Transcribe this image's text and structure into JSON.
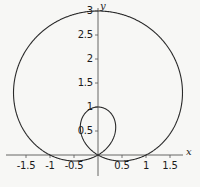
{
  "figure": {
    "background_color": "#f7f7f5",
    "curve_color": "#2a2a2a",
    "axis_color": "#555555",
    "width": 200,
    "height": 187
  },
  "axes": {
    "x_label": "x",
    "y_label": "y",
    "origin_px": {
      "x": 98,
      "y": 155
    },
    "scale_px_per_unit": 48,
    "x_ticks": [
      {
        "value": -1.5,
        "label": "-1.5",
        "px": 26
      },
      {
        "value": -1,
        "label": "-1",
        "px": 50
      },
      {
        "value": -0.5,
        "label": "-0.5",
        "px": 74
      },
      {
        "value": 0.5,
        "label": "0.5",
        "px": 122
      },
      {
        "value": 1,
        "label": "1",
        "px": 146
      },
      {
        "value": 1.5,
        "label": "1.5",
        "px": 170
      }
    ],
    "y_ticks": [
      {
        "value": 3,
        "label": "3",
        "px": 11
      },
      {
        "value": 2.5,
        "label": "2.5",
        "px": 35
      },
      {
        "value": 2,
        "label": "2",
        "px": 59
      },
      {
        "value": 1.5,
        "label": "1.5",
        "px": 83
      },
      {
        "value": 1,
        "label": "1",
        "px": 107
      },
      {
        "value": 0.5,
        "label": "0.5",
        "px": 131
      }
    ]
  },
  "chart_data": {
    "type": "line",
    "title": "",
    "xlabel": "x",
    "ylabel": "y",
    "curve_name": "limacon-with-inner-loop",
    "polar_equation": "r = 1 + 2 sin(theta)",
    "xlim": [
      -1.75,
      1.9
    ],
    "ylim": [
      -0.15,
      3.15
    ],
    "grid": false,
    "legend": "none",
    "key_points": [
      {
        "label": "top of outer loop",
        "x": 0,
        "y": 3
      },
      {
        "label": "leftmost point",
        "x": -1.63,
        "y": 1.13
      },
      {
        "label": "rightmost point",
        "x": 1.63,
        "y": 1.13
      },
      {
        "label": "origin / node",
        "x": 0,
        "y": 0
      },
      {
        "label": "top of inner loop",
        "x": 0,
        "y": 1
      }
    ],
    "x_tick_values": [
      -1.5,
      -1,
      -0.5,
      0.5,
      1,
      1.5
    ],
    "y_tick_values": [
      0.5,
      1,
      1.5,
      2,
      2.5,
      3
    ]
  }
}
